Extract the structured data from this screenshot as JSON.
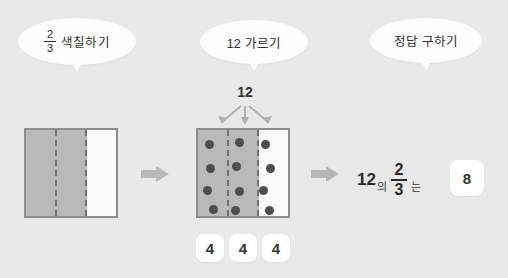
{
  "canvas": {
    "width": 508,
    "height": 278,
    "background": "#e9e9e9"
  },
  "palette": {
    "background": "#e9e9e9",
    "bubble_fill": "#fdfdfd",
    "shaded_cell": "#b9b9b9",
    "plain_cell": "#fbfbfb",
    "rect_border": "#8d8d8d",
    "dashed_divider": "#6f6f6f",
    "dot": "#4d4d4d",
    "arrow": "#b7b7b7",
    "chip_fill": "#ffffff",
    "text": "#2b2b2b"
  },
  "steps": [
    {
      "id": "step-shade",
      "bubble": {
        "fraction_numerator": "2",
        "fraction_denominator": "3",
        "label": "색칠하기"
      }
    },
    {
      "id": "step-partition",
      "bubble": {
        "label": "12 가르기"
      }
    },
    {
      "id": "step-answer",
      "bubble": {
        "label": "정답 구하기"
      }
    }
  ],
  "shade_model": {
    "total_parts": 3,
    "shaded_parts": 2,
    "cells": [
      "shaded",
      "shaded",
      "plain"
    ]
  },
  "partition_model": {
    "total_label": "12",
    "groups": 3,
    "group_values": [
      "4",
      "4",
      "4"
    ],
    "cells": [
      "shaded",
      "shaded",
      "plain"
    ],
    "dots_total": 12,
    "dots": [
      {
        "x": 11,
        "y": 14
      },
      {
        "x": 12,
        "y": 38
      },
      {
        "x": 9,
        "y": 60
      },
      {
        "x": 15,
        "y": 79
      },
      {
        "x": 41,
        "y": 12
      },
      {
        "x": 38,
        "y": 36
      },
      {
        "x": 41,
        "y": 61
      },
      {
        "x": 37,
        "y": 80
      },
      {
        "x": 67,
        "y": 14
      },
      {
        "x": 72,
        "y": 38
      },
      {
        "x": 65,
        "y": 60
      },
      {
        "x": 71,
        "y": 80
      }
    ]
  },
  "answer_model": {
    "base": "12",
    "particle_of": "의",
    "fraction_numerator": "2",
    "fraction_denominator": "3",
    "particle_is": "는",
    "result": "8"
  },
  "flow_arrows": [
    {
      "id": "arrow-shade-to-partition",
      "direction": "right"
    },
    {
      "id": "arrow-partition-to-answer",
      "direction": "right"
    }
  ]
}
